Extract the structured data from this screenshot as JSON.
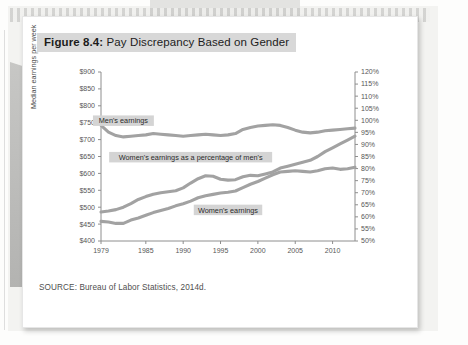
{
  "figure": {
    "number_label": "Figure 8.4:",
    "title": "Pay Discrepancy Based on Gender",
    "source": "SOURCE: Bureau of Labor Statistics, 2014d."
  },
  "chart_data": {
    "type": "line",
    "title": "Pay Discrepancy Based on Gender",
    "xlabel": "",
    "ylabel": "Median earnings per week",
    "y2label": "",
    "xlim": [
      1979,
      2013
    ],
    "ylim": [
      400,
      900
    ],
    "y2lim": [
      50,
      120
    ],
    "grid": false,
    "legend": "inline-labels",
    "x_ticks": [
      "1979",
      "1985",
      "1990",
      "1995",
      "2000",
      "2005",
      "2010"
    ],
    "x_tick_values": [
      1979,
      1985,
      1990,
      1995,
      2000,
      2005,
      2010
    ],
    "y_ticks": [
      "$400",
      "$450",
      "$500",
      "$550",
      "$600",
      "$650",
      "$700",
      "$750",
      "$800",
      "$850",
      "$900"
    ],
    "y_tick_values": [
      400,
      450,
      500,
      550,
      600,
      650,
      700,
      750,
      800,
      850,
      900
    ],
    "y2_ticks": [
      "50%",
      "55%",
      "60%",
      "65%",
      "70%",
      "75%",
      "80%",
      "85%",
      "90%",
      "95%",
      "100%",
      "105%",
      "110%",
      "115%",
      "120%"
    ],
    "y2_tick_values": [
      50,
      55,
      60,
      65,
      70,
      75,
      80,
      85,
      90,
      95,
      100,
      105,
      110,
      115,
      120
    ],
    "line_color": "#a2a2a2",
    "x": [
      1979,
      1980,
      1981,
      1982,
      1983,
      1984,
      1985,
      1986,
      1987,
      1988,
      1989,
      1990,
      1991,
      1992,
      1993,
      1994,
      1995,
      1996,
      1997,
      1998,
      1999,
      2000,
      2001,
      2002,
      2003,
      2004,
      2005,
      2006,
      2007,
      2008,
      2009,
      2010,
      2011,
      2012,
      2013
    ],
    "series": [
      {
        "name": "Men's earnings",
        "axis": "left",
        "label": "Men's earnings",
        "units": "dollars per week",
        "values": [
          742,
          722,
          712,
          708,
          710,
          712,
          714,
          718,
          716,
          714,
          712,
          710,
          712,
          714,
          716,
          714,
          712,
          714,
          718,
          730,
          736,
          740,
          742,
          744,
          742,
          736,
          728,
          722,
          720,
          722,
          726,
          728,
          730,
          732,
          734
        ]
      },
      {
        "name": "Women's earnings",
        "axis": "left",
        "label": "Women's earnings",
        "units": "dollars per week",
        "values": [
          458,
          456,
          452,
          452,
          462,
          468,
          476,
          484,
          490,
          496,
          504,
          510,
          518,
          528,
          534,
          538,
          542,
          544,
          548,
          558,
          568,
          576,
          586,
          596,
          604,
          606,
          608,
          606,
          604,
          608,
          614,
          616,
          612,
          614,
          618
        ]
      },
      {
        "name": "Women's earnings as a percentage of men's",
        "axis": "right",
        "label": "Women's earnings as a percentage of men's",
        "units": "percent",
        "values": [
          62.0,
          62.4,
          63.0,
          64.0,
          65.5,
          67.2,
          68.4,
          69.4,
          70.0,
          70.4,
          70.8,
          72.0,
          74.0,
          75.8,
          77.0,
          76.8,
          75.6,
          75.2,
          75.4,
          76.6,
          77.2,
          77.0,
          77.8,
          78.6,
          80.2,
          81.0,
          81.8,
          82.6,
          83.4,
          85.0,
          87.0,
          88.6,
          90.2,
          91.8,
          93.4
        ]
      }
    ],
    "annotations": [
      {
        "text": "Men's earnings",
        "at_x": 1982,
        "at_y": 756,
        "axis": "left"
      },
      {
        "text": "Women's earnings as a percentage of men's",
        "at_x": 1991,
        "at_y": 648,
        "axis": "left"
      },
      {
        "text": "Women's earnings",
        "at_x": 1996,
        "at_y": 492,
        "axis": "left"
      }
    ]
  }
}
